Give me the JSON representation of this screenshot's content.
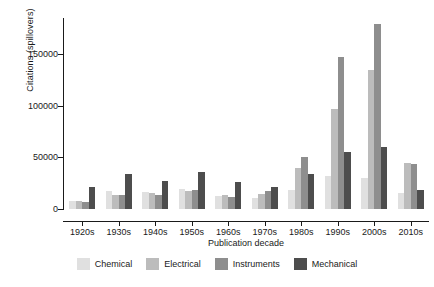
{
  "chart_data": {
    "type": "bar",
    "title": "",
    "xlabel": "Publication decade",
    "ylabel": "Citations (spillovers)",
    "ylim": [
      0,
      185000
    ],
    "yticks": [
      0,
      50000,
      100000,
      150000
    ],
    "ytick_labels": [
      "0",
      "50000",
      "100000",
      "150000"
    ],
    "grid": false,
    "legend_position": "bottom",
    "categories": [
      "1920s",
      "1930s",
      "1940s",
      "1950s",
      "1960s",
      "1970s",
      "1980s",
      "1990s",
      "2000s",
      "2010s"
    ],
    "series": [
      {
        "name": "Chemical",
        "color": "#e0e0e0",
        "values": [
          8000,
          17500,
          16000,
          19000,
          13000,
          10500,
          18500,
          32000,
          30000,
          15500
        ]
      },
      {
        "name": "Electrical",
        "color": "#bcbcbc",
        "values": [
          7500,
          14000,
          15500,
          17000,
          13500,
          15000,
          40000,
          97000,
          135000,
          45000
        ]
      },
      {
        "name": "Instruments",
        "color": "#8e8e8e",
        "values": [
          6500,
          13500,
          14000,
          18000,
          12000,
          17500,
          50000,
          147500,
          179000,
          44000
        ]
      },
      {
        "name": "Mechanical",
        "color": "#4d4d4d",
        "values": [
          21000,
          33500,
          27500,
          35500,
          26500,
          21000,
          34000,
          55500,
          60500,
          18000
        ]
      }
    ]
  },
  "legend": {
    "items": [
      {
        "label": "Chemical",
        "color": "#e0e0e0"
      },
      {
        "label": "Electrical",
        "color": "#bcbcbc"
      },
      {
        "label": "Instruments",
        "color": "#8e8e8e"
      },
      {
        "label": "Mechanical",
        "color": "#4d4d4d"
      }
    ]
  }
}
